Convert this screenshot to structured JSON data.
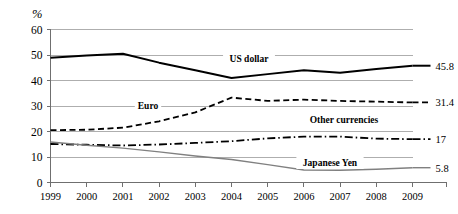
{
  "chart_data": {
    "type": "line",
    "title": "",
    "xlabel": "",
    "ylabel": "%",
    "ylim": [
      0,
      60
    ],
    "ytick_step": 10,
    "yticks": [
      "0",
      "10",
      "20",
      "30",
      "40",
      "50",
      "60"
    ],
    "grid": true,
    "legend": "inline-labels",
    "categories": [
      "1999",
      "2000",
      "2001",
      "2002",
      "2003",
      "2004",
      "2005",
      "2006",
      "2007",
      "2008",
      "2009"
    ],
    "series": [
      {
        "name": "US dollar",
        "style": "solid-thick",
        "color": "#000000",
        "end_label": "45.8",
        "values": [
          48.9,
          49.8,
          50.5,
          47.0,
          44.0,
          41.0,
          42.5,
          44.0,
          43.0,
          44.5,
          45.8
        ]
      },
      {
        "name": "Euro",
        "style": "dashed",
        "color": "#000000",
        "end_label": "31.4",
        "values": [
          20.5,
          20.7,
          21.5,
          24.0,
          27.5,
          33.3,
          32.0,
          32.5,
          32.0,
          31.7,
          31.4
        ]
      },
      {
        "name": "Other currencies",
        "style": "dash-dot",
        "color": "#000000",
        "end_label": "17",
        "values": [
          15.1,
          14.8,
          14.5,
          14.9,
          15.5,
          16.2,
          17.3,
          18.0,
          18.0,
          17.2,
          17.0
        ]
      },
      {
        "name": "Japanese Yen",
        "style": "solid-thin",
        "color": "#808080",
        "end_label": "5.8",
        "values": [
          15.9,
          14.6,
          13.5,
          12.0,
          10.4,
          9.0,
          7.0,
          4.9,
          4.8,
          5.2,
          5.8
        ]
      }
    ]
  },
  "axis": {
    "unit_label": "%"
  }
}
